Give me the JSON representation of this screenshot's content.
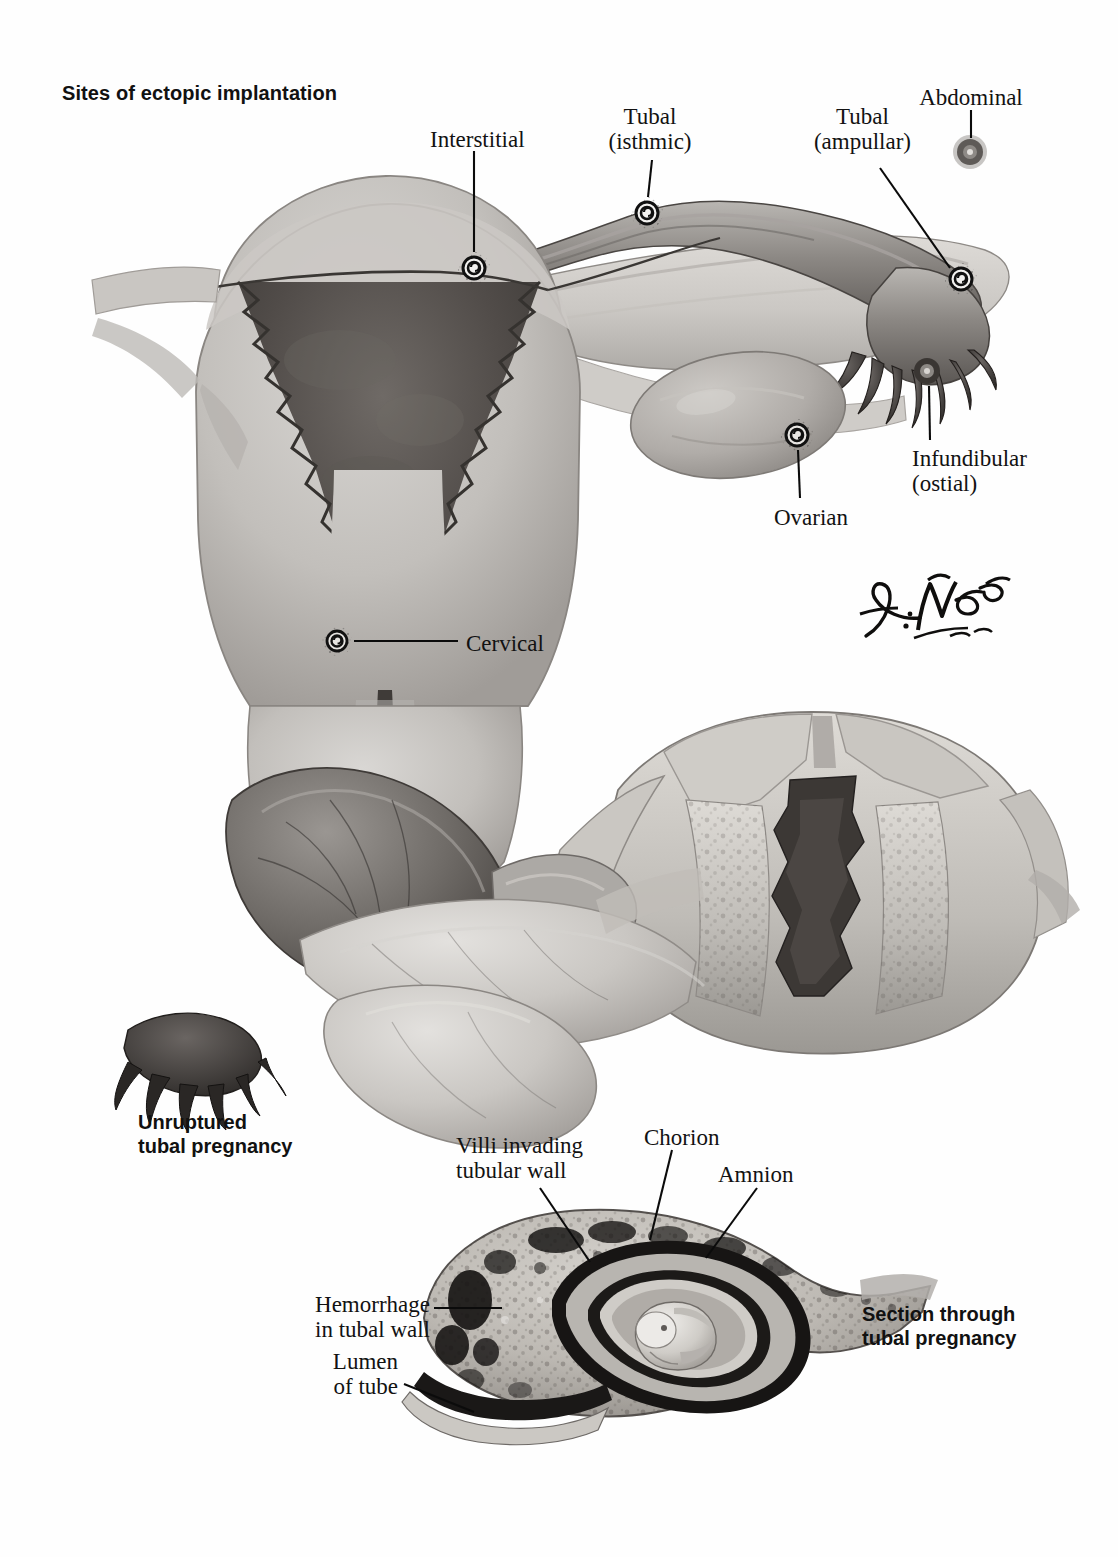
{
  "plate": {
    "title": "Sites of ectopic implantation",
    "signature": "F. Netter, M.D.",
    "background_color": "#ffffff",
    "ink_color": "#111111"
  },
  "top_panel": {
    "name": "sites-of-ectopic-implantation-diagram",
    "labels": [
      {
        "id": "interstitial",
        "text": "Interstitial",
        "x": 430,
        "y": 128,
        "align": "left"
      },
      {
        "id": "tubal-isthmic",
        "text": "Tubal\n(isthmic)",
        "x": 650,
        "y": 105,
        "align": "center"
      },
      {
        "id": "tubal-ampullar",
        "text": "Tubal\n(ampullar)",
        "x": 862,
        "y": 105,
        "align": "center"
      },
      {
        "id": "abdominal",
        "text": "Abdominal",
        "x": 970,
        "y": 86,
        "align": "center"
      },
      {
        "id": "infundibular",
        "text": "Infundibular\n(ostial)",
        "x": 912,
        "y": 447,
        "align": "left"
      },
      {
        "id": "ovarian",
        "text": "Ovarian",
        "x": 774,
        "y": 506,
        "align": "left"
      },
      {
        "id": "cervical",
        "text": "Cervical",
        "x": 466,
        "y": 632,
        "align": "left"
      }
    ],
    "implantation_sites": [
      {
        "id": "interstitial-site",
        "cx": 474,
        "cy": 268
      },
      {
        "id": "isthmic-site",
        "cx": 647,
        "cy": 213
      },
      {
        "id": "ampullar-site",
        "cx": 961,
        "cy": 279
      },
      {
        "id": "abdominal-site",
        "cx": 970,
        "cy": 152
      },
      {
        "id": "infundibular-site",
        "cx": 927,
        "cy": 371
      },
      {
        "id": "ovarian-site",
        "cx": 797,
        "cy": 435
      },
      {
        "id": "cervical-site",
        "cx": 337,
        "cy": 641
      }
    ]
  },
  "middle_panel": {
    "name": "unruptured-tubal-pregnancy-illustration",
    "caption": "Unruptured\ntubal pregnancy",
    "caption_x": 138,
    "caption_y": 1110
  },
  "bottom_panel": {
    "name": "section-through-tubal-pregnancy-illustration",
    "caption": "Section through\ntubal pregnancy",
    "caption_x": 862,
    "caption_y": 1302,
    "labels": [
      {
        "id": "villi-invading",
        "text": "Villi invading\ntubular wall",
        "x": 456,
        "y": 1134,
        "align": "left"
      },
      {
        "id": "chorion",
        "text": "Chorion",
        "x": 644,
        "y": 1126,
        "align": "left"
      },
      {
        "id": "amnion",
        "text": "Amnion",
        "x": 718,
        "y": 1163,
        "align": "left"
      },
      {
        "id": "hemorrhage",
        "text": "Hemorrhage\nin tubal wall",
        "x": 430,
        "y": 1293,
        "align": "right"
      },
      {
        "id": "lumen-of-tube",
        "text": "Lumen\nof tube",
        "x": 398,
        "y": 1350,
        "align": "right"
      }
    ]
  },
  "palette": {
    "tissue_light": "#d2d0cd",
    "tissue_mid": "#b3b0ac",
    "tissue_dark": "#807c78",
    "cavity_dark": "#474341",
    "outline": "#5c5956",
    "hemorrhage": "#1c1a19"
  }
}
